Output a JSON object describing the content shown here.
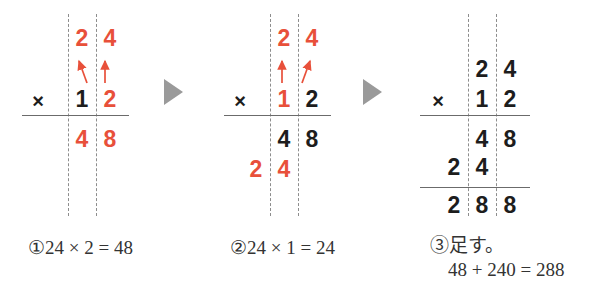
{
  "figure": {
    "accent_red": "#e8503a",
    "ink_black": "#1d1d1d",
    "guide_gray": "#8d8d8d",
    "arrow_gray": "#9a9a9a"
  },
  "separators": [
    {
      "name": "step-1-to-2",
      "glyph": "play-triangle"
    },
    {
      "name": "step-2-to-3",
      "glyph": "play-triangle"
    }
  ],
  "panels": [
    {
      "id": "step-1",
      "operator": "×",
      "rows": [
        {
          "name": "multiplicand-row",
          "cells": [
            {
              "value": "",
              "color": "black"
            },
            {
              "value": "2",
              "color": "red"
            },
            {
              "value": "4",
              "color": "red"
            }
          ]
        },
        {
          "name": "multiplier-row",
          "cells": [
            {
              "value": "",
              "color": "black"
            },
            {
              "value": "1",
              "color": "black"
            },
            {
              "value": "2",
              "color": "red"
            }
          ]
        },
        {
          "name": "partial-product-1",
          "cells": [
            {
              "value": "",
              "color": "black"
            },
            {
              "value": "4",
              "color": "red"
            },
            {
              "value": "8",
              "color": "red"
            }
          ]
        }
      ],
      "arrows": [
        {
          "name": "carry-arrow-diagonal-left",
          "direction": "up-left"
        },
        {
          "name": "carry-arrow-vertical-right",
          "direction": "up"
        }
      ],
      "caption": {
        "index": "①",
        "text": "24 × 2 = 48"
      }
    },
    {
      "id": "step-2",
      "operator": "×",
      "rows": [
        {
          "name": "multiplicand-row",
          "cells": [
            {
              "value": "",
              "color": "black"
            },
            {
              "value": "2",
              "color": "red"
            },
            {
              "value": "4",
              "color": "red"
            }
          ]
        },
        {
          "name": "multiplier-row",
          "cells": [
            {
              "value": "",
              "color": "black"
            },
            {
              "value": "1",
              "color": "red"
            },
            {
              "value": "2",
              "color": "black"
            }
          ]
        },
        {
          "name": "partial-product-1",
          "cells": [
            {
              "value": "",
              "color": "black"
            },
            {
              "value": "4",
              "color": "black"
            },
            {
              "value": "8",
              "color": "black"
            }
          ]
        },
        {
          "name": "partial-product-2",
          "cells": [
            {
              "value": "2",
              "color": "red"
            },
            {
              "value": "4",
              "color": "red"
            },
            {
              "value": "",
              "color": "black"
            }
          ]
        }
      ],
      "arrows": [
        {
          "name": "carry-arrow-vertical-left",
          "direction": "up"
        },
        {
          "name": "carry-arrow-diagonal-right",
          "direction": "up-right"
        }
      ],
      "caption": {
        "index": "②",
        "text": "24 × 1 = 24"
      }
    },
    {
      "id": "step-3",
      "operator": "×",
      "rows": [
        {
          "name": "multiplicand-row",
          "cells": [
            {
              "value": "",
              "color": "black"
            },
            {
              "value": "2",
              "color": "black"
            },
            {
              "value": "4",
              "color": "black"
            }
          ]
        },
        {
          "name": "multiplier-row",
          "cells": [
            {
              "value": "",
              "color": "black"
            },
            {
              "value": "1",
              "color": "black"
            },
            {
              "value": "2",
              "color": "black"
            }
          ]
        },
        {
          "name": "partial-product-1",
          "cells": [
            {
              "value": "",
              "color": "black"
            },
            {
              "value": "4",
              "color": "black"
            },
            {
              "value": "8",
              "color": "black"
            }
          ]
        },
        {
          "name": "partial-product-2",
          "cells": [
            {
              "value": "2",
              "color": "black"
            },
            {
              "value": "4",
              "color": "black"
            },
            {
              "value": "",
              "color": "black"
            }
          ]
        },
        {
          "name": "total-row",
          "cells": [
            {
              "value": "2",
              "color": "black"
            },
            {
              "value": "8",
              "color": "black"
            },
            {
              "value": "8",
              "color": "black"
            }
          ]
        }
      ],
      "arrows": [],
      "caption": {
        "index": "③",
        "text": "足す。",
        "line2": "48 + 240 = 288"
      }
    }
  ]
}
